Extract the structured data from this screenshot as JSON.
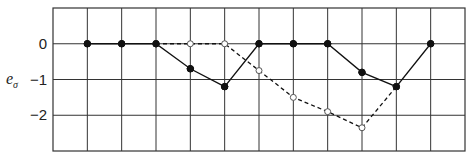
{
  "chart_data": {
    "type": "line",
    "title": "",
    "xlabel": "",
    "ylabel": "e_σ",
    "ylabel_main": "e",
    "ylabel_sub": "σ",
    "ylim": [
      -3,
      1
    ],
    "yticks": [
      0,
      -1,
      -2
    ],
    "ytick_labels": [
      "0",
      "−1",
      "−2"
    ],
    "x_grid_columns": 12,
    "grid": true,
    "x": [
      1,
      2,
      3,
      4,
      5,
      6,
      7,
      8,
      9,
      10,
      11
    ],
    "series": [
      {
        "name": "solid",
        "style": "solid",
        "marker": "filled-circle",
        "x": [
          1,
          2,
          3,
          4,
          5,
          6,
          7,
          8,
          9,
          10,
          11
        ],
        "values": [
          0,
          0,
          0,
          -0.7,
          -1.2,
          0,
          0,
          0,
          -0.8,
          -1.2,
          0
        ]
      },
      {
        "name": "dashed",
        "style": "dashed",
        "marker": "open-circle",
        "x": [
          3,
          4,
          5,
          6,
          7,
          8,
          9,
          10
        ],
        "values": [
          0,
          0,
          0,
          -0.75,
          -1.5,
          -1.9,
          -2.35,
          -1.2
        ]
      }
    ]
  },
  "colors": {
    "grid": "#333333",
    "line": "#111111",
    "open_marker_fill": "#ffffff"
  }
}
